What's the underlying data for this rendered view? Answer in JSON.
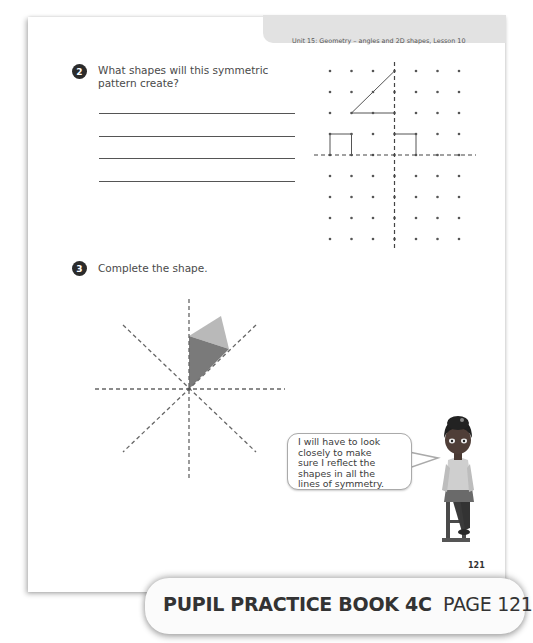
{
  "header": {
    "unit_title": "Unit 15: Geometry – angles and 2D shapes, Lesson 10"
  },
  "question2": {
    "number": "2",
    "text_line1": "What shapes will this symmetric",
    "text_line2": "pattern create?",
    "answer_lines": 4,
    "dot_grid": {
      "columns": 7,
      "rows": 9,
      "mirror_lines": [
        "vertical",
        "horizontal"
      ],
      "shapes_drawn": [
        "right-angled triangle (top-left quadrant)",
        "rectangle (top-left quadrant)",
        "partial rectangle (top-right quadrant)"
      ]
    }
  },
  "question3": {
    "number": "3",
    "text": "Complete the shape.",
    "diagram": {
      "lines_of_symmetry": 4,
      "colors": {
        "dark_triangle": "#7a7a7a",
        "light_triangle": "#b9b9b9"
      }
    }
  },
  "speech_bubble": {
    "line1": "I will have to look",
    "line2": "closely to make",
    "line3": "sure I reflect the",
    "line4": "shapes in all the",
    "line5": "lines of symmetry."
  },
  "footer": {
    "page_number": "121",
    "book_label_bold": "PUPIL PRACTICE BOOK 4C",
    "book_label_page": "PAGE 121"
  }
}
